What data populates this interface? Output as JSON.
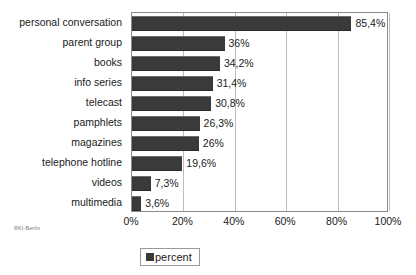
{
  "source_note": "RKI-Berlin",
  "legend": {
    "position": "bottom",
    "entries": [
      {
        "label": "percent",
        "color": "#3a3a3a"
      }
    ]
  },
  "chart_data": {
    "type": "bar",
    "orientation": "horizontal",
    "title": "",
    "subtitle": "",
    "xlabel": "",
    "ylabel": "",
    "xlim": [
      0,
      100
    ],
    "grid": true,
    "series_name": "percent",
    "bar_color": "#3a3a3a",
    "categories": [
      "personal conversation",
      "parent group",
      "books",
      "info series",
      "telecast",
      "pamphlets",
      "magazines",
      "telephone hotline",
      "videos",
      "multimedia"
    ],
    "values": [
      85.4,
      36,
      34.2,
      31.4,
      30.8,
      26.3,
      26,
      19.6,
      7.3,
      3.6
    ],
    "value_labels": [
      "85,4%",
      "36%",
      "34,2%",
      "31,4%",
      "30,8%",
      "26,3%",
      "26%",
      "19,6%",
      "7,3%",
      "3,6%"
    ],
    "xticks": [
      0,
      20,
      40,
      60,
      80,
      100
    ],
    "xtick_labels": [
      "0%",
      "20%",
      "40%",
      "60%",
      "80%",
      "100%"
    ]
  }
}
